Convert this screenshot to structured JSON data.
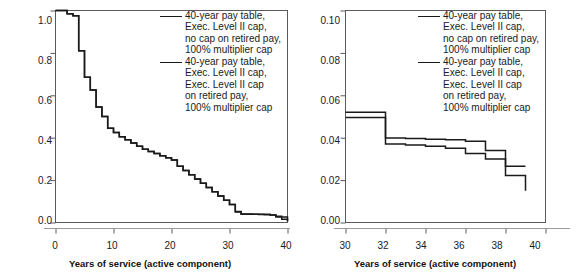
{
  "figure": {
    "legend_entries": [
      {
        "id": "no-cap-retired-pay",
        "lines": [
          "40-year pay table,",
          "Exec. Level II cap,",
          "no cap on retired pay,",
          "100% multiplier cap"
        ]
      },
      {
        "id": "exec-level-ii-cap-retired-pay",
        "lines": [
          "40-year pay table,",
          "Exec. Level II cap,",
          "Exec. Level II cap",
          "on retired pay,",
          "100% multiplier cap"
        ]
      }
    ],
    "line_color": "#1a1a1a",
    "frame_color": "#5a5a5a"
  },
  "chart_data": [
    {
      "panel": "left",
      "type": "line",
      "title": "",
      "xlabel": "Years of service (active component)",
      "ylabel": "Cumulative retention rate",
      "xlim": [
        0,
        40
      ],
      "ylim": [
        0.0,
        1.0
      ],
      "xticks": [
        0,
        10,
        20,
        30,
        40
      ],
      "xtick_labels": [
        "0",
        "10",
        "20",
        "30",
        "40"
      ],
      "yticks": [
        0.0,
        0.2,
        0.4,
        0.6,
        0.8,
        1.0
      ],
      "ytick_labels": [
        "0.0",
        "0.2",
        "0.4",
        "0.6",
        "0.8",
        "1.0"
      ],
      "grid": false,
      "legend_position": "upper right",
      "step_style": "post",
      "series": [
        {
          "name": "40-year pay table, Exec. Level II cap, no cap on retired pay, 100% multiplier cap",
          "x": [
            0,
            1,
            2,
            3,
            4,
            5,
            6,
            7,
            8,
            9,
            10,
            11,
            12,
            13,
            14,
            15,
            16,
            17,
            18,
            19,
            20,
            21,
            22,
            23,
            24,
            25,
            26,
            27,
            28,
            29,
            30,
            31,
            32,
            33,
            34,
            35,
            36,
            37,
            38,
            39,
            40
          ],
          "y": [
            1.0,
            1.0,
            0.985,
            0.975,
            0.81,
            0.685,
            0.625,
            0.545,
            0.5,
            0.445,
            0.425,
            0.405,
            0.39,
            0.375,
            0.36,
            0.345,
            0.335,
            0.325,
            0.315,
            0.305,
            0.295,
            0.265,
            0.245,
            0.225,
            0.205,
            0.185,
            0.165,
            0.145,
            0.125,
            0.105,
            0.085,
            0.05,
            0.04,
            0.04,
            0.039,
            0.038,
            0.037,
            0.035,
            0.03,
            0.015,
            0.006
          ]
        },
        {
          "name": "40-year pay table, Exec. Level II cap, Exec. Level II cap on retired pay, 100% multiplier cap",
          "x": [
            0,
            1,
            2,
            3,
            4,
            5,
            6,
            7,
            8,
            9,
            10,
            11,
            12,
            13,
            14,
            15,
            16,
            17,
            18,
            19,
            20,
            21,
            22,
            23,
            24,
            25,
            26,
            27,
            28,
            29,
            30,
            31,
            32,
            33,
            34,
            35,
            36,
            37,
            38,
            39,
            40
          ],
          "y": [
            1.0,
            1.0,
            0.985,
            0.975,
            0.81,
            0.685,
            0.625,
            0.545,
            0.5,
            0.445,
            0.425,
            0.405,
            0.39,
            0.375,
            0.36,
            0.345,
            0.335,
            0.325,
            0.315,
            0.305,
            0.295,
            0.265,
            0.245,
            0.225,
            0.205,
            0.185,
            0.165,
            0.145,
            0.125,
            0.105,
            0.085,
            0.052,
            0.0395,
            0.0395,
            0.039,
            0.0385,
            0.0385,
            0.0355,
            0.0265,
            0.0265,
            0.006
          ]
        }
      ]
    },
    {
      "panel": "right",
      "type": "line",
      "title": "",
      "xlabel": "Years of service (active component)",
      "ylabel": "",
      "xlim": [
        30,
        40
      ],
      "ylim": [
        0.0,
        0.1
      ],
      "xticks": [
        30,
        32,
        34,
        36,
        38,
        40
      ],
      "xtick_labels": [
        "30",
        "32",
        "34",
        "36",
        "38",
        "40"
      ],
      "yticks": [
        0.0,
        0.02,
        0.04,
        0.06,
        0.08,
        0.1
      ],
      "ytick_labels": [
        "0.00",
        "0.02",
        "0.04",
        "0.06",
        "0.08",
        "0.10"
      ],
      "grid": false,
      "legend_position": "upper right",
      "step_style": "post",
      "series": [
        {
          "name": "40-year pay table, Exec. Level II cap, no cap on retired pay, 100% multiplier cap",
          "x": [
            30,
            31,
            32,
            33,
            34,
            35,
            36,
            37,
            38,
            39
          ],
          "y": [
            0.0495,
            0.0495,
            0.037,
            0.0365,
            0.036,
            0.035,
            0.0325,
            0.03,
            0.0222,
            0.015
          ]
        },
        {
          "name": "40-year pay table, Exec. Level II cap, Exec. Level II cap on retired pay, 100% multiplier cap",
          "x": [
            30,
            31,
            32,
            33,
            34,
            35,
            36,
            37,
            38,
            39
          ],
          "y": [
            0.052,
            0.052,
            0.0398,
            0.0396,
            0.0393,
            0.039,
            0.0383,
            0.034,
            0.0265,
            0.0265
          ]
        }
      ]
    }
  ]
}
